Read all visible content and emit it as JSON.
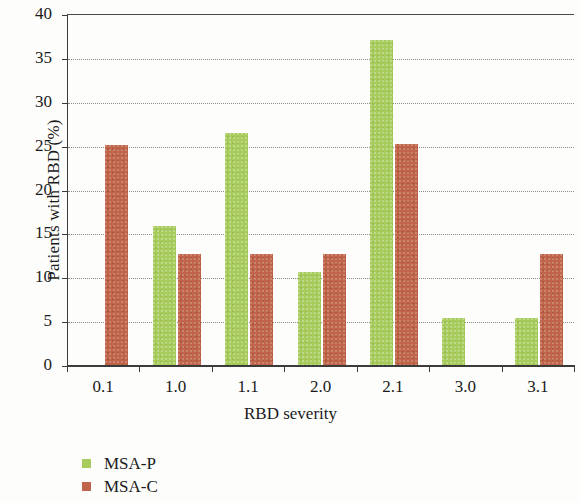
{
  "chart_data": {
    "type": "bar",
    "title": "",
    "xlabel": "RBD severity",
    "ylabel": "Patients with RBD (%)",
    "categories": [
      "0.1",
      "1.0",
      "1.1",
      "2.0",
      "2.1",
      "3.0",
      "3.1"
    ],
    "ylim": [
      0,
      40
    ],
    "yticks": [
      0,
      5,
      10,
      15,
      20,
      25,
      30,
      35,
      40
    ],
    "ytick_labels": [
      "0",
      "5",
      "10",
      "15",
      "20",
      "25",
      "30",
      "35",
      "40"
    ],
    "grid": "horizontal-dotted",
    "legend_position": "below-left",
    "series": [
      {
        "name": "MSA-P",
        "color": "#a8cc5c",
        "values": [
          0,
          15.8,
          26.4,
          10.6,
          37.0,
          5.4,
          5.4
        ]
      },
      {
        "name": "MSA-C",
        "color": "#c0644a",
        "values": [
          25.1,
          12.7,
          12.7,
          12.7,
          25.2,
          0,
          12.7
        ]
      }
    ]
  }
}
